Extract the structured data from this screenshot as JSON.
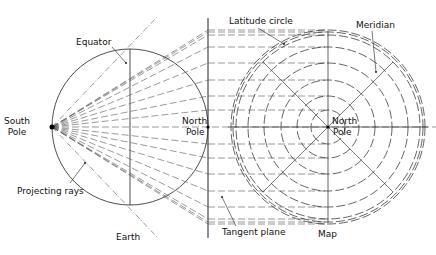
{
  "labels": {
    "equator": "Equator",
    "south_pole_1": "South",
    "south_pole_2": "Pole",
    "north_pole_earth_1": "North",
    "north_pole_earth_2": "Pole",
    "projecting_rays": "Projecting rays",
    "earth": "Earth",
    "latitude_circle": "Latitude circle",
    "meridian": "Meridian",
    "north_pole_map_1": "North",
    "north_pole_map_2": "Pole",
    "tangent_plane": "Tangent plane",
    "map": "Map"
  },
  "geometry": {
    "earth_center": [
      130,
      127
    ],
    "earth_radius": 78,
    "south_pole": [
      52,
      127
    ],
    "tangent_plane_x": 208,
    "map_center": [
      328,
      127
    ],
    "map_radii": [
      17,
      31,
      47,
      64,
      80,
      92,
      95,
      97
    ],
    "colors": {
      "line": "#222222",
      "dash": "#555555"
    }
  }
}
